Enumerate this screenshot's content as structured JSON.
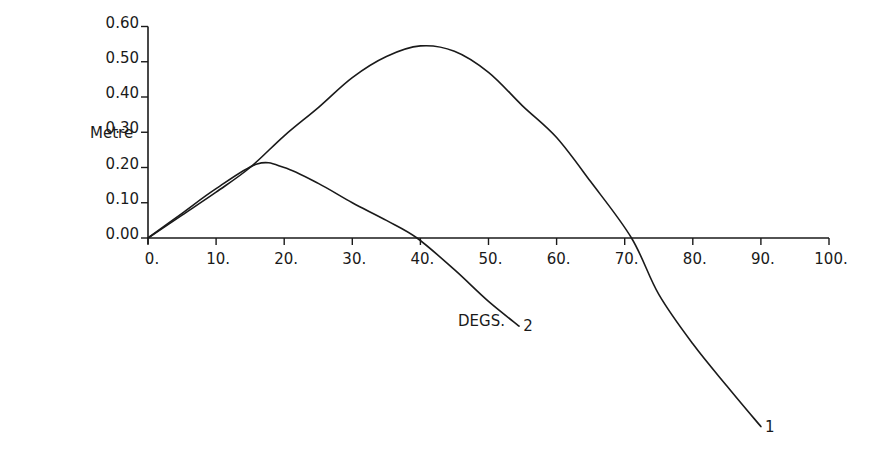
{
  "chart_data": {
    "type": "line",
    "title": "",
    "xlabel": "DEGS.",
    "ylabel": "Metre",
    "xlim": [
      0,
      100
    ],
    "ylim": [
      0.0,
      0.6
    ],
    "grid": false,
    "legend": "inline labels at curve ends",
    "x_ticks": [
      0,
      10,
      20,
      30,
      40,
      50,
      60,
      70,
      80,
      90,
      100
    ],
    "x_tick_labels": [
      "0.",
      "10.",
      "20.",
      "30.",
      "40.",
      "50.",
      "60.",
      "70.",
      "80.",
      "90.",
      "100."
    ],
    "y_ticks": [
      0.0,
      0.1,
      0.2,
      0.3,
      0.4,
      0.5,
      0.6
    ],
    "y_tick_labels": [
      "0.00",
      "0.10",
      "0.20",
      "0.30",
      "0.40",
      "0.50",
      "0.60"
    ],
    "series": [
      {
        "name": "1",
        "x": [
          0,
          5,
          10,
          15,
          20,
          25,
          30,
          35,
          40,
          45,
          50,
          55,
          60,
          65,
          71,
          75,
          80,
          85,
          90
        ],
        "values": [
          0.0,
          0.065,
          0.13,
          0.2,
          0.29,
          0.37,
          0.455,
          0.515,
          0.545,
          0.53,
          0.47,
          0.375,
          0.285,
          0.16,
          0.0,
          -0.16,
          -0.3,
          -0.42,
          -0.535
        ]
      },
      {
        "name": "2",
        "x": [
          0,
          5,
          10,
          16,
          20,
          25,
          30,
          35,
          39.5,
          45,
          50,
          54.5
        ],
        "values": [
          0.0,
          0.07,
          0.14,
          0.21,
          0.2,
          0.155,
          0.1,
          0.05,
          0.0,
          -0.09,
          -0.18,
          -0.25
        ]
      }
    ]
  },
  "labels": {
    "y_axis_title": "Metre",
    "x_axis_title": "DEGS.",
    "series_1_label": "1",
    "series_2_label": "2"
  },
  "colors": {
    "ink": "#1a1a1a",
    "background": "#ffffff"
  }
}
